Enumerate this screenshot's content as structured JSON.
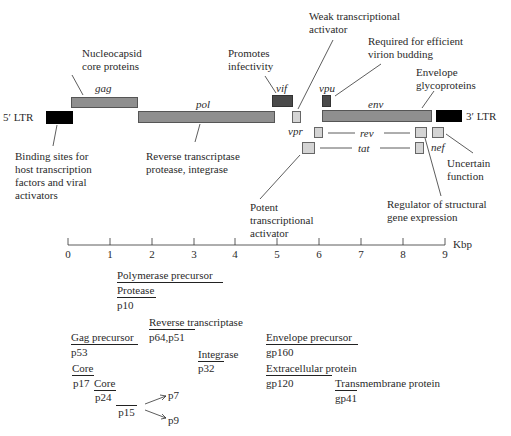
{
  "diagram": {
    "genes": {
      "ltr5": "5′ LTR",
      "gag": "gag",
      "pol": "pol",
      "vif": "vif",
      "vpr": "vpr",
      "vpu": "vpu",
      "env": "env",
      "ltr3": "3′ LTR",
      "rev": "rev",
      "tat": "tat",
      "nef": "nef"
    },
    "annotations": {
      "gag_l1": "Nucleocapsid",
      "gag_l2": "core proteins",
      "vif_l1": "Promotes",
      "vif_l2": "infectivity",
      "vpr_l1": "Weak transcriptional",
      "vpr_l2": "activator",
      "vpu_l1": "Required for efficient",
      "vpu_l2": "virion budding",
      "env_l1": "Envelope",
      "env_l2": "glycoproteins",
      "ltr_l1": "Binding sites for",
      "ltr_l2": "host transcription",
      "ltr_l3": "factors and viral",
      "ltr_l4": "activators",
      "pol_l1": "Reverse transcriptase",
      "pol_l2": "protease, integrase",
      "tat_l1": "Potent",
      "tat_l2": "transcriptional",
      "tat_l3": "activator",
      "rev_l1": "Regulator of structural",
      "rev_l2": "gene expression",
      "nef_l1": "Uncertain",
      "nef_l2": "function"
    },
    "axis": {
      "unit": "Kbp",
      "ticks": [
        "0",
        "1",
        "2",
        "3",
        "4",
        "5",
        "6",
        "7",
        "8",
        "9"
      ]
    },
    "proteins": {
      "pol_precursor": "Polymerase precursor",
      "protease": "Protease",
      "p10": "p10",
      "rt": "Reverse transcriptase",
      "p64p51": "p64,p51",
      "gag_precursor": "Gag precursor",
      "p53": "p53",
      "integrase": "Integrase",
      "p32": "p32",
      "core1": "Core",
      "p17": "p17",
      "core2": "Core",
      "p24": "p24",
      "p15": "p15",
      "p7": "p7",
      "p9": "p9",
      "env_precursor": "Envelope precursor",
      "gp160": "gp160",
      "extracellular": "Extracellular protein",
      "gp120": "gp120",
      "transmembrane": "Transmembrane protein",
      "gp41": "gp41"
    },
    "colors": {
      "structural": "#8f8f8f",
      "accessory_dark": "#4a4a4a",
      "regulatory_light": "#d4d4d4",
      "ltr": "#000000"
    }
  }
}
